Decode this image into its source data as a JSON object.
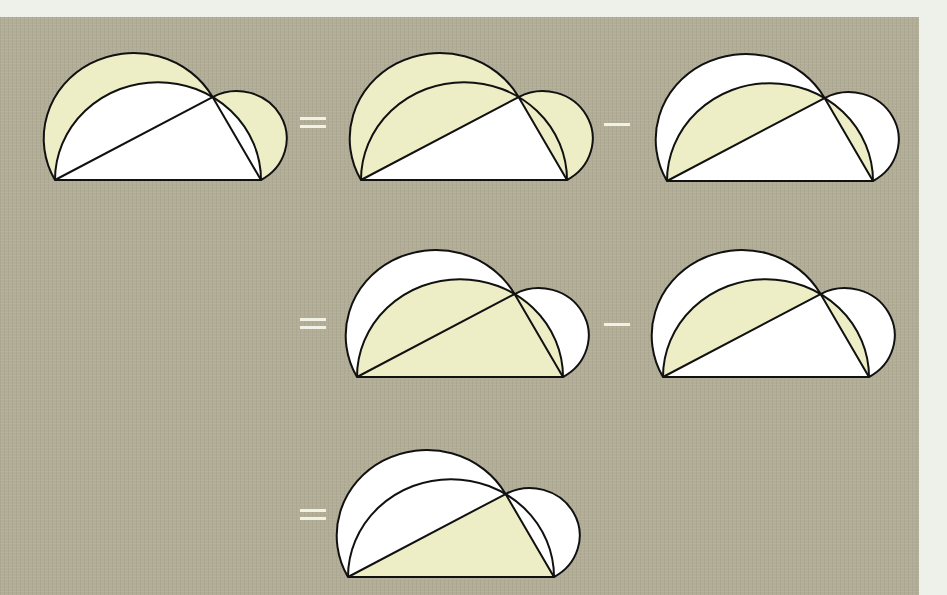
{
  "figure": {
    "colors": {
      "background": "#b1ad96",
      "page": "#eef1ea",
      "shade": "#eeeec6",
      "white": "#ffffff",
      "stroke": "#111111",
      "operator": "#f1f1e6"
    },
    "rows": [
      {
        "row": 1,
        "items": [
          {
            "kind": "figure",
            "shading": "lunes",
            "label": "Two lunes shaded"
          },
          {
            "kind": "operator",
            "symbol": "="
          },
          {
            "kind": "figure",
            "shading": "leg-semicircles",
            "label": "Semicircles on the two legs shaded"
          },
          {
            "kind": "operator",
            "symbol": "−"
          },
          {
            "kind": "figure",
            "shading": "segments",
            "label": "Segments between hypotenuse arc and legs shaded"
          }
        ]
      },
      {
        "row": 2,
        "items": [
          {
            "kind": "operator",
            "symbol": "="
          },
          {
            "kind": "figure",
            "shading": "hypotenuse-semicircle",
            "label": "Semicircle on hypotenuse shaded"
          },
          {
            "kind": "operator",
            "symbol": "−"
          },
          {
            "kind": "figure",
            "shading": "segments",
            "label": "Segments between hypotenuse arc and legs shaded"
          }
        ]
      },
      {
        "row": 3,
        "items": [
          {
            "kind": "operator",
            "symbol": "="
          },
          {
            "kind": "figure",
            "shading": "triangle",
            "label": "Right triangle shaded"
          }
        ]
      }
    ]
  }
}
